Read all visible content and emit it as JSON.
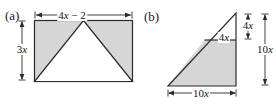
{
  "figure": {
    "type": "geometry-diagram",
    "width": 276,
    "height": 104,
    "background_color": "#ffffff",
    "stroke_color": "#2b2b2b",
    "shade_color": "#d6d6d6",
    "unshaded_color": "#ffffff"
  },
  "panels": [
    {
      "id": "a",
      "label": "(a)",
      "shape": "rectangle-with-inscribed-triangle",
      "description": "Rectangle with an inscribed white triangle whose apex is at the midpoint of the top side and whose base is the bottom side; the two corner regions are shaded.",
      "dimensions": [
        {
          "name": "width",
          "label_text": "4x − 2",
          "label_parts": [
            {
              "text": "4",
              "style": "roman"
            },
            {
              "text": "x",
              "style": "italic"
            },
            {
              "text": " − 2",
              "style": "roman"
            }
          ],
          "position": "top",
          "arrow": "double"
        },
        {
          "name": "height",
          "label_text": "3x",
          "label_parts": [
            {
              "text": "3",
              "style": "roman"
            },
            {
              "text": "x",
              "style": "italic"
            }
          ],
          "position": "left",
          "arrow": "double"
        }
      ]
    },
    {
      "id": "b",
      "label": "(b)",
      "shape": "right-triangle-with-cut-line",
      "description": "Right triangle with horizontal base and vertical right leg; a horizontal segment cuts off a small similar triangle at the top, leaving a shaded trapezoid below.",
      "dimensions": [
        {
          "name": "cut-segment",
          "label_text": "4x",
          "label_parts": [
            {
              "text": "4",
              "style": "roman"
            },
            {
              "text": "x",
              "style": "italic"
            }
          ],
          "position": "interior-cut-line",
          "arrow": "none"
        },
        {
          "name": "upper-height",
          "label_text": "4x",
          "label_parts": [
            {
              "text": "4",
              "style": "roman"
            },
            {
              "text": "x",
              "style": "italic"
            }
          ],
          "position": "right-inner",
          "arrow": "double"
        },
        {
          "name": "total-height",
          "label_text": "10x",
          "label_parts": [
            {
              "text": "10",
              "style": "roman"
            },
            {
              "text": "x",
              "style": "italic"
            }
          ],
          "position": "right-outer",
          "arrow": "double"
        },
        {
          "name": "base",
          "label_text": "10x",
          "label_parts": [
            {
              "text": "10",
              "style": "roman"
            },
            {
              "text": "x",
              "style": "italic"
            }
          ],
          "position": "bottom",
          "arrow": "double"
        }
      ]
    }
  ]
}
